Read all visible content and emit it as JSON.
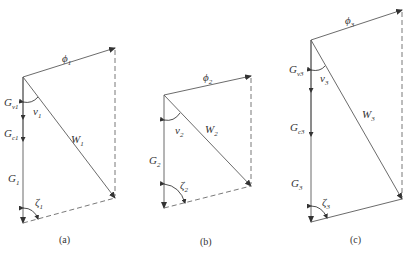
{
  "figure": {
    "panels": [
      {
        "id": "a",
        "caption": "(a)",
        "phi": {
          "base": "ϕ",
          "sub": "1"
        },
        "W": {
          "base": "W",
          "sub": "1"
        },
        "G": {
          "base": "G",
          "sub": "1"
        },
        "G_nu": {
          "base": "G",
          "sub": "ν1"
        },
        "G_c": {
          "base": "G",
          "sub": "c1"
        },
        "nu": {
          "base": "ν",
          "sub": "1"
        },
        "zeta": {
          "base": "ζ",
          "sub": "1"
        },
        "bottom_line": "dashed"
      },
      {
        "id": "b",
        "caption": "(b)",
        "phi": {
          "base": "ϕ",
          "sub": "2"
        },
        "W": {
          "base": "W",
          "sub": "2"
        },
        "G": {
          "base": "G",
          "sub": "2"
        },
        "nu": {
          "base": "ν",
          "sub": "2"
        },
        "zeta": {
          "base": "ζ",
          "sub": "2"
        },
        "bottom_line": "dashed"
      },
      {
        "id": "c",
        "caption": "(c)",
        "phi": {
          "base": "ϕ",
          "sub": "3"
        },
        "W": {
          "base": "W",
          "sub": "3"
        },
        "G": {
          "base": "G",
          "sub": "3"
        },
        "G_nu": {
          "base": "G",
          "sub": "ν3"
        },
        "G_c": {
          "base": "G",
          "sub": "c3"
        },
        "nu": {
          "base": "ν",
          "sub": "3"
        },
        "zeta": {
          "base": "ζ",
          "sub": "3"
        },
        "bottom_line": "solid"
      }
    ]
  }
}
